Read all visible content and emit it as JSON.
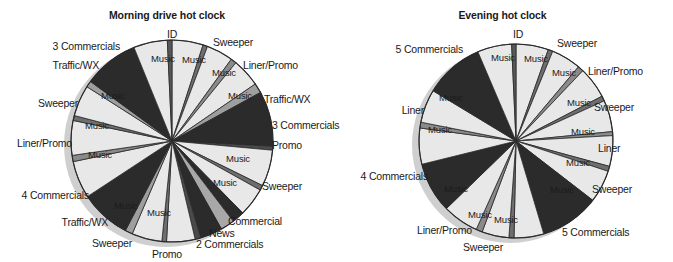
{
  "figure": {
    "background": "#ffffff",
    "palette": {
      "music": "#e8e8e8",
      "commercial": "#2b2b2b",
      "news": "#a8a8a8",
      "sweeper": "#6e6e6e",
      "liner": "#8a8a8a",
      "promo": "#4a4a4a",
      "traffic": "#9e9e9e",
      "id": "#585858",
      "shadow": "#cfcfcf",
      "outline": "#2a2a2a",
      "text": "#1a1a1a"
    }
  },
  "charts": [
    {
      "id": "morning-drive-hot-clock",
      "title": "Morning drive hot clock",
      "center": {
        "x": 172,
        "y": 141
      },
      "radius": 101,
      "chart_data": {
        "type": "pie",
        "title": "Morning drive hot clock",
        "legend": "none",
        "units": "minutes of a 60-minute clock",
        "start_angle_deg": 0,
        "direction": "clockwise",
        "categories": [
          "Music",
          "Sweeper",
          "Music",
          "Liner/Promo",
          "Music",
          "Traffic/WX",
          "3 Commercials",
          "Promo",
          "Music",
          "Sweeper",
          "Music",
          "Commercial",
          "News",
          "2 Commercials",
          "Promo",
          "Music",
          "Sweeper",
          "Music",
          "Traffic/WX",
          "4 Commercials",
          "Music",
          "Liner/Promo",
          "Music",
          "Sweeper",
          "Music",
          "Traffic/WX",
          "3 Commercials",
          "Music",
          "ID"
        ],
        "values": [
          5.0,
          0.7,
          4.2,
          0.9,
          4.6,
          1.6,
          9.0,
          0.6,
          5.8,
          0.8,
          4.6,
          2.0,
          2.2,
          3.6,
          0.9,
          4.6,
          0.7,
          4.8,
          1.2,
          8.2,
          6.0,
          1.0,
          5.6,
          0.8,
          5.0,
          1.0,
          9.0,
          5.4,
          0.7
        ]
      },
      "slices": [
        {
          "label": "Music",
          "span": 17.5,
          "fill": "music"
        },
        {
          "label": "Sweeper",
          "span": 2.6,
          "fill": "sweeper"
        },
        {
          "label": "Music",
          "span": 15.0,
          "fill": "music"
        },
        {
          "label": "Liner/Promo",
          "span": 3.2,
          "fill": "liner"
        },
        {
          "label": "Music",
          "span": 16.0,
          "fill": "music"
        },
        {
          "label": "Traffic/WX",
          "span": 5.5,
          "fill": "traffic"
        },
        {
          "label": "3 Commercials",
          "span": 31.0,
          "fill": "commercial"
        },
        {
          "label": "Promo",
          "span": 2.2,
          "fill": "promo"
        },
        {
          "label": "Music",
          "span": 20.5,
          "fill": "music"
        },
        {
          "label": "Sweeper",
          "span": 2.8,
          "fill": "sweeper"
        },
        {
          "label": "Music",
          "span": 16.0,
          "fill": "music"
        },
        {
          "label": "Commercial",
          "span": 7.0,
          "fill": "commercial"
        },
        {
          "label": "News",
          "span": 7.8,
          "fill": "news"
        },
        {
          "label": "2 Commercials",
          "span": 12.5,
          "fill": "commercial"
        },
        {
          "label": "Promo",
          "span": 3.2,
          "fill": "promo"
        },
        {
          "label": "Music",
          "span": 16.0,
          "fill": "music"
        },
        {
          "label": "Sweeper",
          "span": 2.6,
          "fill": "sweeper"
        },
        {
          "label": "Music",
          "span": 17.0,
          "fill": "music"
        },
        {
          "label": "Traffic/WX",
          "span": 4.2,
          "fill": "traffic"
        },
        {
          "label": "4 Commercials",
          "span": 28.5,
          "fill": "commercial"
        },
        {
          "label": "Music",
          "span": 21.0,
          "fill": "music"
        },
        {
          "label": "Liner/Promo",
          "span": 3.5,
          "fill": "liner"
        },
        {
          "label": "Music",
          "span": 19.5,
          "fill": "music"
        },
        {
          "label": "Sweeper",
          "span": 2.8,
          "fill": "sweeper"
        },
        {
          "label": "Music",
          "span": 17.5,
          "fill": "music"
        },
        {
          "label": "Traffic/WX",
          "span": 3.5,
          "fill": "traffic"
        },
        {
          "label": "3 Commercials",
          "span": 31.0,
          "fill": "commercial"
        },
        {
          "label": "Music",
          "span": 19.0,
          "fill": "music"
        },
        {
          "label": "ID",
          "span": 2.6,
          "fill": "id"
        }
      ],
      "inner_labels": [
        {
          "text": "Music",
          "x": 194,
          "y": 60
        },
        {
          "text": "Music",
          "x": 224,
          "y": 73
        },
        {
          "text": "Music",
          "x": 240,
          "y": 96
        },
        {
          "text": "Music",
          "x": 238,
          "y": 159
        },
        {
          "text": "Music",
          "x": 225,
          "y": 183
        },
        {
          "text": "Music",
          "x": 159,
          "y": 213
        },
        {
          "text": "Music",
          "x": 126,
          "y": 206
        },
        {
          "text": "Music",
          "x": 100,
          "y": 155
        },
        {
          "text": "Music",
          "x": 97,
          "y": 126
        },
        {
          "text": "Music",
          "x": 113,
          "y": 96
        },
        {
          "text": "Music",
          "x": 163,
          "y": 59
        }
      ],
      "callouts": [
        {
          "text": "ID",
          "x": 172,
          "y": 34,
          "align": "c"
        },
        {
          "text": "Sweeper",
          "x": 213,
          "y": 42,
          "align": "r"
        },
        {
          "text": "Liner/Promo",
          "x": 243,
          "y": 65,
          "align": "r"
        },
        {
          "text": "Traffic/WX",
          "x": 264,
          "y": 99,
          "align": "r"
        },
        {
          "text": "3 Commercials",
          "x": 272,
          "y": 125,
          "align": "r"
        },
        {
          "text": "Promo",
          "x": 272,
          "y": 145,
          "align": "r"
        },
        {
          "text": "Sweeper",
          "x": 262,
          "y": 186,
          "align": "r"
        },
        {
          "text": "Commercial",
          "x": 228,
          "y": 221,
          "align": "r"
        },
        {
          "text": "News",
          "x": 209,
          "y": 233,
          "align": "r"
        },
        {
          "text": "2 Commercials",
          "x": 196,
          "y": 244,
          "align": "r"
        },
        {
          "text": "Promo",
          "x": 182,
          "y": 254,
          "align": "l"
        },
        {
          "text": "Sweeper",
          "x": 132,
          "y": 243,
          "align": "l"
        },
        {
          "text": "Traffic/WX",
          "x": 108,
          "y": 222,
          "align": "l"
        },
        {
          "text": "4 Commercials",
          "x": 89,
          "y": 195,
          "align": "l"
        },
        {
          "text": "Liner/Promo",
          "x": 72,
          "y": 143,
          "align": "l"
        },
        {
          "text": "Sweeper",
          "x": 78,
          "y": 103,
          "align": "l"
        },
        {
          "text": "Traffic/WX",
          "x": 99,
          "y": 65,
          "align": "l"
        },
        {
          "text": "3 Commercials",
          "x": 120,
          "y": 46,
          "align": "l"
        }
      ]
    },
    {
      "id": "evening-hot-clock",
      "title": "Evening hot clock",
      "center": {
        "x": 176,
        "y": 141
      },
      "radius": 97,
      "chart_data": {
        "type": "pie",
        "title": "Evening hot clock",
        "legend": "none",
        "units": "minutes of a 60-minute clock",
        "start_angle_deg": 0,
        "direction": "clockwise",
        "categories": [
          "Music",
          "Sweeper",
          "Music",
          "Liner/Promo",
          "Music",
          "Sweeper",
          "Music",
          "Liner",
          "Music",
          "Sweeper",
          "Music",
          "5 Commercials",
          "Music",
          "Sweeper",
          "Music",
          "Liner/Promo",
          "Music",
          "4 Commercials",
          "Music",
          "Liner",
          "Music",
          "5 Commercials",
          "Music",
          "ID"
        ],
        "values": [
          5.2,
          0.7,
          4.6,
          0.9,
          5.0,
          0.8,
          5.0,
          0.6,
          4.8,
          0.8,
          5.2,
          9.5,
          4.6,
          0.8,
          4.2,
          1.0,
          5.6,
          8.0,
          5.6,
          0.9,
          5.2,
          9.5,
          5.4,
          0.7
        ]
      },
      "slices": [
        {
          "label": "Music",
          "span": 18.0,
          "fill": "music"
        },
        {
          "label": "Sweeper",
          "span": 2.6,
          "fill": "sweeper"
        },
        {
          "label": "Music",
          "span": 16.5,
          "fill": "music"
        },
        {
          "label": "Liner/Promo",
          "span": 3.2,
          "fill": "liner"
        },
        {
          "label": "Music",
          "span": 17.5,
          "fill": "music"
        },
        {
          "label": "Sweeper",
          "span": 2.8,
          "fill": "sweeper"
        },
        {
          "label": "Music",
          "span": 17.5,
          "fill": "music"
        },
        {
          "label": "Liner",
          "span": 2.2,
          "fill": "liner"
        },
        {
          "label": "Music",
          "span": 17.0,
          "fill": "music"
        },
        {
          "label": "Sweeper",
          "span": 2.8,
          "fill": "sweeper"
        },
        {
          "label": "Music",
          "span": 18.0,
          "fill": "music"
        },
        {
          "label": "5 Commercials",
          "span": 33.0,
          "fill": "commercial"
        },
        {
          "label": "Music",
          "span": 16.5,
          "fill": "music"
        },
        {
          "label": "Sweeper",
          "span": 2.8,
          "fill": "sweeper"
        },
        {
          "label": "Music",
          "span": 15.0,
          "fill": "music"
        },
        {
          "label": "Liner/Promo",
          "span": 3.5,
          "fill": "liner"
        },
        {
          "label": "Music",
          "span": 20.0,
          "fill": "music"
        },
        {
          "label": "4 Commercials",
          "span": 28.0,
          "fill": "commercial"
        },
        {
          "label": "Music",
          "span": 20.0,
          "fill": "music"
        },
        {
          "label": "Liner",
          "span": 3.2,
          "fill": "liner"
        },
        {
          "label": "Music",
          "span": 18.5,
          "fill": "music"
        },
        {
          "label": "5 Commercials",
          "span": 33.0,
          "fill": "commercial"
        },
        {
          "label": "Music",
          "span": 19.0,
          "fill": "music"
        },
        {
          "label": "ID",
          "span": 2.4,
          "fill": "id"
        }
      ],
      "inner_labels": [
        {
          "text": "Music",
          "x": 196,
          "y": 59
        },
        {
          "text": "Music",
          "x": 224,
          "y": 73
        },
        {
          "text": "Music",
          "x": 239,
          "y": 103
        },
        {
          "text": "Music",
          "x": 243,
          "y": 132
        },
        {
          "text": "Music",
          "x": 238,
          "y": 163
        },
        {
          "text": "Music",
          "x": 222,
          "y": 190
        },
        {
          "text": "Music",
          "x": 166,
          "y": 220
        },
        {
          "text": "Music",
          "x": 140,
          "y": 215
        },
        {
          "text": "Music",
          "x": 116,
          "y": 189
        },
        {
          "text": "Music",
          "x": 100,
          "y": 130
        },
        {
          "text": "Music",
          "x": 111,
          "y": 98
        },
        {
          "text": "Music",
          "x": 163,
          "y": 58
        }
      ],
      "callouts": [
        {
          "text": "ID",
          "x": 178,
          "y": 34,
          "align": "c"
        },
        {
          "text": "Sweeper",
          "x": 217,
          "y": 43,
          "align": "r"
        },
        {
          "text": "Liner/Promo",
          "x": 248,
          "y": 71,
          "align": "r"
        },
        {
          "text": "Sweeper",
          "x": 254,
          "y": 107,
          "align": "r"
        },
        {
          "text": "Liner",
          "x": 258,
          "y": 148,
          "align": "r"
        },
        {
          "text": "Sweeper",
          "x": 252,
          "y": 189,
          "align": "r"
        },
        {
          "text": "5 Commercials",
          "x": 222,
          "y": 232,
          "align": "r"
        },
        {
          "text": "Sweeper",
          "x": 163,
          "y": 247,
          "align": "l"
        },
        {
          "text": "Liner/Promo",
          "x": 132,
          "y": 230,
          "align": "l"
        },
        {
          "text": "4 Commercials",
          "x": 88,
          "y": 176,
          "align": "l"
        },
        {
          "text": "Liner",
          "x": 84,
          "y": 110,
          "align": "l"
        },
        {
          "text": "5 Commercials",
          "x": 123,
          "y": 49,
          "align": "l"
        }
      ]
    }
  ]
}
